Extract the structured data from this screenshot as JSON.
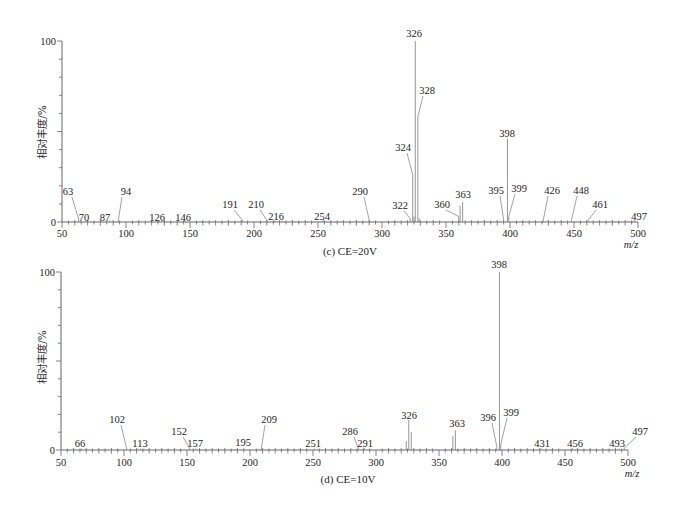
{
  "chart_data": [
    {
      "type": "bar",
      "subtype": "mass-spectrum-sticks",
      "title": "(c) CE=20V",
      "xlabel": "m/z",
      "ylabel": "相对丰度/%",
      "xlim": [
        50,
        500
      ],
      "ylim": [
        0,
        100
      ],
      "xticks": [
        50,
        100,
        150,
        200,
        250,
        300,
        350,
        400,
        450,
        500
      ],
      "yticks": [
        0,
        100
      ],
      "grid": false,
      "legend": null,
      "x": [
        63,
        70,
        87,
        94,
        126,
        146,
        191,
        210,
        216,
        254,
        290,
        322,
        324,
        325,
        326,
        328,
        329,
        360,
        361,
        363,
        395,
        398,
        399,
        426,
        448,
        461,
        497
      ],
      "values": [
        1.5,
        0.8,
        0.8,
        1,
        0.8,
        0.8,
        1,
        1,
        0.8,
        1,
        1,
        2,
        26,
        3,
        100,
        58,
        2,
        3,
        9,
        11,
        1.5,
        46,
        3,
        1,
        1,
        1,
        1
      ],
      "annotations": [
        {
          "mz": 63,
          "text": "63",
          "pos": [
            68,
            191
          ],
          "leader": true
        },
        {
          "mz": 70,
          "text": "70",
          "pos": [
            84,
            217
          ],
          "leader": false
        },
        {
          "mz": 87,
          "text": "87",
          "pos": [
            105,
            217
          ],
          "leader": false
        },
        {
          "mz": 94,
          "text": "94",
          "pos": [
            126,
            191
          ],
          "leader": true
        },
        {
          "mz": 126,
          "text": "126",
          "pos": [
            157,
            217
          ],
          "leader": false
        },
        {
          "mz": 146,
          "text": "146",
          "pos": [
            183,
            217
          ],
          "leader": false
        },
        {
          "mz": 191,
          "text": "191",
          "pos": [
            230,
            204
          ],
          "leader": true
        },
        {
          "mz": 210,
          "text": "210",
          "pos": [
            256,
            204
          ],
          "leader": true
        },
        {
          "mz": 216,
          "text": "216",
          "pos": [
            276,
            216
          ],
          "leader": false
        },
        {
          "mz": 254,
          "text": "254",
          "pos": [
            322,
            216
          ],
          "leader": false
        },
        {
          "mz": 290,
          "text": "290",
          "pos": [
            360,
            191
          ],
          "leader": true
        },
        {
          "mz": 322,
          "text": "322",
          "pos": [
            400,
            205
          ],
          "leader": true
        },
        {
          "mz": 324,
          "text": "324",
          "pos": [
            403,
            147
          ],
          "leader": true
        },
        {
          "mz": 326,
          "text": "326",
          "pos": [
            414,
            33
          ],
          "leader": false
        },
        {
          "mz": 328,
          "text": "328",
          "pos": [
            427,
            90
          ],
          "leader": true
        },
        {
          "mz": 360,
          "text": "360",
          "pos": [
            442,
            204
          ],
          "leader": true
        },
        {
          "mz": 363,
          "text": "363",
          "pos": [
            463,
            194
          ],
          "leader": false
        },
        {
          "mz": 395,
          "text": "395",
          "pos": [
            496,
            190
          ],
          "leader": true
        },
        {
          "mz": 398,
          "text": "398",
          "pos": [
            507,
            133
          ],
          "leader": false
        },
        {
          "mz": 399,
          "text": "399",
          "pos": [
            519,
            188
          ],
          "leader": true
        },
        {
          "mz": 426,
          "text": "426",
          "pos": [
            552,
            190
          ],
          "leader": true
        },
        {
          "mz": 448,
          "text": "448",
          "pos": [
            581,
            190
          ],
          "leader": true
        },
        {
          "mz": 461,
          "text": "461",
          "pos": [
            600,
            204
          ],
          "leader": true
        },
        {
          "mz": 497,
          "text": "497",
          "pos": [
            639,
            216
          ],
          "leader": false
        }
      ]
    },
    {
      "type": "bar",
      "subtype": "mass-spectrum-sticks",
      "title": "(d) CE=10V",
      "xlabel": "m/z",
      "ylabel": "相对丰度/%",
      "xlim": [
        50,
        500
      ],
      "ylim": [
        0,
        100
      ],
      "xticks": [
        50,
        100,
        150,
        200,
        250,
        300,
        350,
        400,
        450,
        500
      ],
      "yticks": [
        0,
        100
      ],
      "grid": false,
      "legend": null,
      "x": [
        66,
        102,
        113,
        152,
        157,
        195,
        209,
        251,
        286,
        291,
        324,
        326,
        328,
        361,
        363,
        396,
        398,
        399,
        431,
        456,
        493,
        497
      ],
      "values": [
        0.8,
        1,
        0.8,
        1,
        0.8,
        0.8,
        1,
        0.8,
        1,
        0.8,
        5,
        17,
        10,
        8,
        11,
        1.5,
        100,
        3,
        0.8,
        0.8,
        0.8,
        1
      ],
      "annotations": [
        {
          "mz": 66,
          "text": "66",
          "pos": [
            80,
            443
          ],
          "leader": false
        },
        {
          "mz": 102,
          "text": "102",
          "pos": [
            117,
            419
          ],
          "leader": true
        },
        {
          "mz": 113,
          "text": "113",
          "pos": [
            140,
            443
          ],
          "leader": false
        },
        {
          "mz": 152,
          "text": "152",
          "pos": [
            179,
            431
          ],
          "leader": true
        },
        {
          "mz": 157,
          "text": "157",
          "pos": [
            195,
            443
          ],
          "leader": false
        },
        {
          "mz": 195,
          "text": "195",
          "pos": [
            243,
            442
          ],
          "leader": false
        },
        {
          "mz": 209,
          "text": "209",
          "pos": [
            269,
            419
          ],
          "leader": true
        },
        {
          "mz": 251,
          "text": "251",
          "pos": [
            313,
            443
          ],
          "leader": false
        },
        {
          "mz": 286,
          "text": "286",
          "pos": [
            350,
            431
          ],
          "leader": true
        },
        {
          "mz": 291,
          "text": "291",
          "pos": [
            365,
            443
          ],
          "leader": false
        },
        {
          "mz": 326,
          "text": "326",
          "pos": [
            409,
            415
          ],
          "leader": false
        },
        {
          "mz": 363,
          "text": "363",
          "pos": [
            457,
            423
          ],
          "leader": false
        },
        {
          "mz": 396,
          "text": "396",
          "pos": [
            488,
            417
          ],
          "leader": true
        },
        {
          "mz": 398,
          "text": "398",
          "pos": [
            499,
            264
          ],
          "leader": false
        },
        {
          "mz": 399,
          "text": "399",
          "pos": [
            511,
            412
          ],
          "leader": true
        },
        {
          "mz": 431,
          "text": "431",
          "pos": [
            542,
            443
          ],
          "leader": false
        },
        {
          "mz": 456,
          "text": "456",
          "pos": [
            575,
            443
          ],
          "leader": false
        },
        {
          "mz": 493,
          "text": "493",
          "pos": [
            617,
            443
          ],
          "leader": false
        },
        {
          "mz": 497,
          "text": "497",
          "pos": [
            640,
            431
          ],
          "leader": true
        }
      ]
    }
  ]
}
